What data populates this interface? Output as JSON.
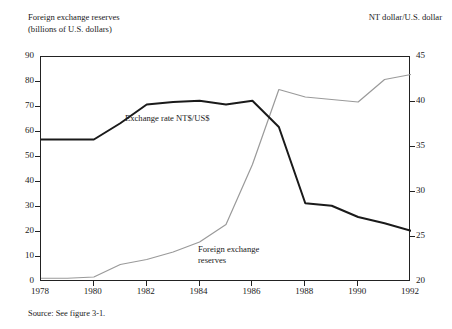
{
  "header": {
    "left_caption": "Foreign exchange reserves\n(billions of U.S. dollars)",
    "right_caption": "NT dollar/U.S. dollar"
  },
  "footer": {
    "source_note": "Source: See figure 3-1."
  },
  "labels": {
    "exchange_rate": "Exchange rate NT$/US$",
    "reserves": "Foreign exchange\nreserves"
  },
  "axes": {
    "left_ticks": [
      "0",
      "10",
      "20",
      "30",
      "40",
      "50",
      "60",
      "70",
      "80",
      "90"
    ],
    "right_ticks": [
      "20",
      "25",
      "30",
      "35",
      "40",
      "45"
    ],
    "x_ticks": [
      "1978",
      "1980",
      "1982",
      "1984",
      "1986",
      "1988",
      "1990",
      "1992"
    ]
  },
  "colors": {
    "exchange_rate_line": "#1a1a1a",
    "reserves_line": "#9a9a9a",
    "frame": "#222222",
    "background": "#ffffff"
  },
  "chart_data": {
    "type": "line",
    "title": "",
    "subtitle": "",
    "xlabel": "",
    "ylabel": "Foreign exchange reserves (billions of U.S. dollars)",
    "y2label": "NT dollar/U.S. dollar",
    "grid": false,
    "legend": "in-plot annotations",
    "x": [
      1978,
      1979,
      1980,
      1981,
      1982,
      1983,
      1984,
      1985,
      1986,
      1987,
      1988,
      1989,
      1990,
      1991,
      1992
    ],
    "xlim": [
      1978,
      1992
    ],
    "ylim": [
      0,
      90
    ],
    "y2lim": [
      20,
      45
    ],
    "series": [
      {
        "name": "Foreign exchange reserves",
        "axis": "left",
        "units": "billions of U.S. dollars",
        "color": "#9a9a9a",
        "values": [
          1.5,
          1.5,
          2.0,
          7.0,
          9.0,
          12.0,
          16.0,
          23.0,
          47.0,
          77.0,
          74.0,
          73.0,
          72.0,
          81.0,
          83.0
        ]
      },
      {
        "name": "Exchange rate NT$/US$",
        "axis": "right",
        "units": "NT dollar/U.S. dollar",
        "color": "#1a1a1a",
        "values": [
          36.0,
          36.0,
          36.0,
          37.8,
          39.9,
          40.1,
          40.2,
          39.9,
          40.2,
          37.2,
          28.6,
          28.4,
          27.1,
          26.4,
          25.6
        ],
        "values_on_left_scale": [
          57.0,
          57.0,
          57.0,
          63.5,
          71.0,
          72.0,
          72.5,
          71.0,
          72.5,
          62.0,
          31.5,
          30.5,
          26.0,
          23.5,
          20.5
        ]
      }
    ],
    "annotations": [
      {
        "text": "Exchange rate NT$/US$",
        "near_x": 1982,
        "series": "Exchange rate NT$/US$"
      },
      {
        "text": "Foreign exchange reserves",
        "near_x": 1986,
        "series": "Foreign exchange reserves"
      }
    ]
  }
}
